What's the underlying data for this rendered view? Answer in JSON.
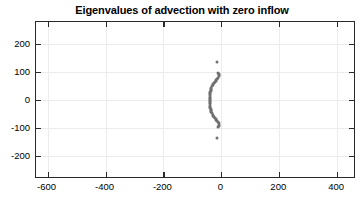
{
  "figure": {
    "width": 364,
    "height": 204,
    "background": "#ffffff",
    "axes_color": "#2a2a2a",
    "grid_color": "#ececec",
    "marker_color": "#707070"
  },
  "chart_data": {
    "type": "scatter",
    "title": "Eigenvalues of advection with zero inflow",
    "xlabel": "",
    "ylabel": "",
    "xlim": [
      -640,
      465
    ],
    "ylim": [
      -282,
      278
    ],
    "xticks": [
      -600,
      -400,
      -200,
      0,
      200,
      400
    ],
    "xticklabels": [
      "-600",
      "-400",
      "-200",
      "0",
      "200",
      "400"
    ],
    "yticks": [
      200,
      100,
      0,
      -100,
      -200
    ],
    "yticklabels": [
      "200",
      "100",
      "0",
      "-100",
      "-200"
    ],
    "grid": true,
    "legend": null,
    "marker": "dot",
    "marker_size": 3,
    "series": [
      {
        "name": "eigenvalues",
        "color": "#707070",
        "points": [
          [
            -15,
            137
          ],
          [
            -12,
            96
          ],
          [
            -9,
            92
          ],
          [
            -8,
            88
          ],
          [
            -9,
            84
          ],
          [
            -11,
            80
          ],
          [
            -14,
            76
          ],
          [
            -17,
            72
          ],
          [
            -20,
            68
          ],
          [
            -23,
            64
          ],
          [
            -26,
            60
          ],
          [
            -28,
            56
          ],
          [
            -30,
            52
          ],
          [
            -32,
            48
          ],
          [
            -34,
            44
          ],
          [
            -35,
            40
          ],
          [
            -36,
            36
          ],
          [
            -37,
            32
          ],
          [
            -38,
            28
          ],
          [
            -38,
            24
          ],
          [
            -39,
            20
          ],
          [
            -39,
            16
          ],
          [
            -39,
            12
          ],
          [
            -39,
            8
          ],
          [
            -39,
            4
          ],
          [
            -39,
            0
          ],
          [
            -39,
            -4
          ],
          [
            -39,
            -8
          ],
          [
            -39,
            -12
          ],
          [
            -39,
            -16
          ],
          [
            -39,
            -20
          ],
          [
            -38,
            -24
          ],
          [
            -38,
            -28
          ],
          [
            -37,
            -32
          ],
          [
            -36,
            -36
          ],
          [
            -35,
            -40
          ],
          [
            -34,
            -44
          ],
          [
            -32,
            -48
          ],
          [
            -30,
            -52
          ],
          [
            -28,
            -56
          ],
          [
            -26,
            -60
          ],
          [
            -23,
            -64
          ],
          [
            -20,
            -68
          ],
          [
            -17,
            -72
          ],
          [
            -14,
            -76
          ],
          [
            -11,
            -80
          ],
          [
            -9,
            -84
          ],
          [
            -8,
            -88
          ],
          [
            -9,
            -92
          ],
          [
            -12,
            -96
          ],
          [
            -15,
            -137
          ]
        ]
      }
    ]
  }
}
